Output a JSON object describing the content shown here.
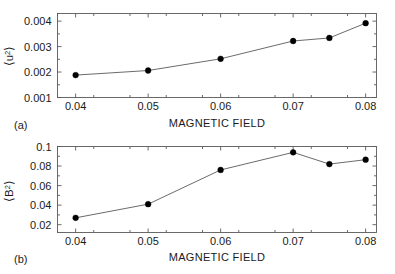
{
  "figure": {
    "background": "#ffffff",
    "line_color": "#6b6b6b",
    "marker_color": "#000000",
    "frame_color": "#5a5a5a"
  },
  "chart_data": [
    {
      "type": "line",
      "panel": "(a)",
      "title": "",
      "xlabel": "MAGNETIC FIELD",
      "ylabel": "⟨u²⟩",
      "ylabel_base": "⟨u",
      "ylabel_exp": "2",
      "ylabel_close": "⟩",
      "x": [
        0.04,
        0.05,
        0.06,
        0.07,
        0.075,
        0.08
      ],
      "values": [
        0.00188,
        0.00206,
        0.00252,
        0.00322,
        0.00334,
        0.00392
      ],
      "xlim": [
        0.0375,
        0.0815
      ],
      "ylim": [
        0.001,
        0.0043
      ],
      "xticks": [
        0.04,
        0.05,
        0.06,
        0.07,
        0.08
      ],
      "xticklabels": [
        "0.04",
        "0.05",
        "0.06",
        "0.07",
        "0.08"
      ],
      "yticks": [
        0.001,
        0.002,
        0.003,
        0.004
      ],
      "yticklabels": [
        "0.001",
        "0.002",
        "0.003",
        "0.004"
      ],
      "grid": false,
      "legend": null,
      "marker": "filled-circle"
    },
    {
      "type": "line",
      "panel": "(b)",
      "title": "",
      "xlabel": "MAGNETIC FIELD",
      "ylabel": "⟨B²⟩",
      "ylabel_base": "⟨B",
      "ylabel_exp": "2",
      "ylabel_close": "⟩",
      "x": [
        0.04,
        0.05,
        0.06,
        0.07,
        0.075,
        0.08
      ],
      "values": [
        0.027,
        0.041,
        0.076,
        0.094,
        0.082,
        0.0865
      ],
      "xlim": [
        0.0375,
        0.0815
      ],
      "ylim": [
        0.012,
        0.1
      ],
      "xticks": [
        0.04,
        0.05,
        0.06,
        0.07,
        0.08
      ],
      "xticklabels": [
        "0.04",
        "0.05",
        "0.06",
        "0.07",
        "0.08"
      ],
      "yticks": [
        0.02,
        0.04,
        0.06,
        0.08,
        0.1
      ],
      "yticklabels": [
        "0.02",
        "0.04",
        "0.06",
        "0.08",
        "0.1"
      ],
      "grid": false,
      "legend": null,
      "marker": "filled-circle"
    }
  ]
}
